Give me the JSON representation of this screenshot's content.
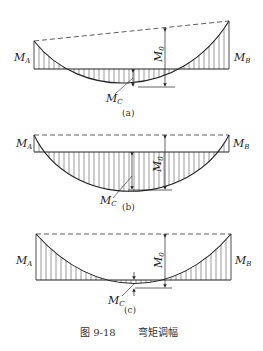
{
  "figure": {
    "caption_number": "图 9-18",
    "caption_title": "弯矩调幅"
  },
  "panels": [
    {
      "id": "a",
      "label": "(a)",
      "MA": "M",
      "MA_sub": "A",
      "MB": "M",
      "MB_sub": "B",
      "M0": "M",
      "M0_sub": "0",
      "MC": "M",
      "MC_sub": "C"
    },
    {
      "id": "b",
      "label": "(b)",
      "MA": "M",
      "MA_sub": "A",
      "MB": "M",
      "MB_sub": "B",
      "M0": "M",
      "M0_sub": "0",
      "MC": "M",
      "MC_sub": "C"
    },
    {
      "id": "c",
      "label": "(c)",
      "MA": "M",
      "MA_sub": "A",
      "MB": "M",
      "MB_sub": "B",
      "M0": "M",
      "M0_sub": "0",
      "MC": "M",
      "MC_sub": "C"
    }
  ],
  "colors": {
    "line": "#222222",
    "hatch": "#555555",
    "background": "#ffffff"
  }
}
